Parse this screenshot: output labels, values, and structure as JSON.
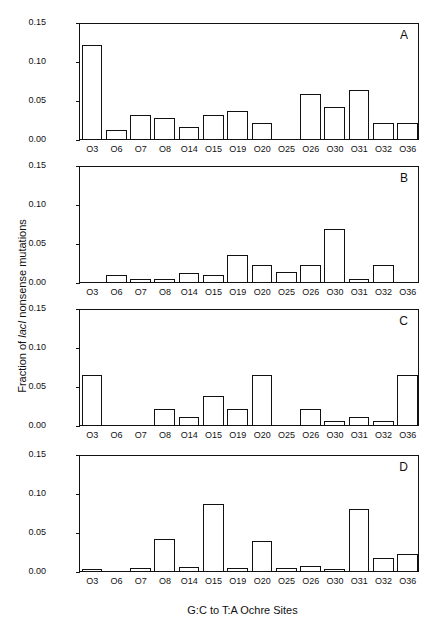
{
  "chart_data": {
    "type": "bar",
    "ylabel": "Fraction of lacI nonsense mutations",
    "ylabel_parts": {
      "pre": "Fraction of ",
      "italic": "lacI",
      "post": " nonsense mutations"
    },
    "xlabel": "G:C to T:A Ochre Sites",
    "ylim": [
      0,
      0.15
    ],
    "yticks": [
      "0.00",
      "0.05",
      "0.10",
      "0.15"
    ],
    "grid": false,
    "categories": [
      "O3",
      "O6",
      "O7",
      "O8",
      "O14",
      "O15",
      "O19",
      "O20",
      "O25",
      "O26",
      "O30",
      "O31",
      "O32",
      "O36"
    ],
    "panels": [
      {
        "label": "A",
        "values": [
          0.124,
          0.012,
          0.032,
          0.027,
          0.016,
          0.032,
          0.037,
          0.021,
          0.0,
          0.059,
          0.042,
          0.064,
          0.021,
          0.021
        ]
      },
      {
        "label": "B",
        "values": [
          0.0,
          0.009,
          0.004,
          0.004,
          0.012,
          0.009,
          0.035,
          0.022,
          0.013,
          0.022,
          0.07,
          0.004,
          0.022,
          0.0
        ]
      },
      {
        "label": "C",
        "values": [
          0.066,
          0.0,
          0.0,
          0.021,
          0.011,
          0.038,
          0.021,
          0.066,
          0.0,
          0.021,
          0.005,
          0.011,
          0.005,
          0.066
        ]
      },
      {
        "label": "D",
        "values": [
          0.001,
          0.0,
          0.004,
          0.042,
          0.005,
          0.088,
          0.004,
          0.04,
          0.004,
          0.007,
          0.001,
          0.081,
          0.017,
          0.022
        ]
      }
    ]
  },
  "layout": {
    "panel_tops": [
      23,
      166,
      309,
      455
    ]
  }
}
